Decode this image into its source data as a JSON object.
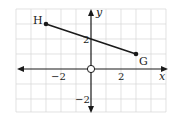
{
  "diagram": {
    "type": "coordinate-plane",
    "axes": {
      "x_label": "x",
      "y_label": "y"
    },
    "ticks": {
      "x_neg": "−2",
      "x_pos": "2",
      "y_pos": "2",
      "y_neg": "−2"
    },
    "points": [
      {
        "name": "H",
        "x": -3,
        "y": 3
      },
      {
        "name": "G",
        "x": 3,
        "y": 1
      }
    ],
    "segment": {
      "from": "H",
      "to": "G"
    },
    "y_intercept_mark": 2,
    "origin_marker": "open-circle",
    "grid": {
      "x_min": -5,
      "x_max": 5,
      "y_min": -3,
      "y_max": 4,
      "unit_px": 15
    },
    "colors": {
      "grid": "#d6d6d6",
      "ink": "#1a1a1a"
    }
  }
}
